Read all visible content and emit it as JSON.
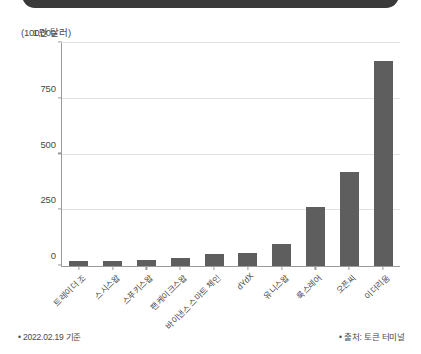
{
  "chart_data": {
    "type": "bar",
    "title": "",
    "subtitle": "",
    "unit_label": "(100만 달러)",
    "xlabel": "",
    "ylabel": "",
    "ylim": [
      0,
      1000
    ],
    "yticks": [
      0,
      250,
      500,
      750,
      1000
    ],
    "ytick_labels": [
      "0",
      "250",
      "500",
      "750",
      "1,000"
    ],
    "grid": true,
    "legend": "none",
    "bar_color": "#5e5e5e",
    "categories": [
      "트레이더 조",
      "스시스왑",
      "스푸키스왑",
      "팬케이크스왑",
      "바이낸스 스마트 체인",
      "dYdX",
      "유니스왑",
      "룩스레어",
      "오픈씨",
      "이더리움"
    ],
    "values": [
      22,
      24,
      25,
      38,
      56,
      60,
      100,
      265,
      420,
      920
    ]
  },
  "footnotes": {
    "left": "• 2022.02.19 기준",
    "right": "• 출처: 토큰 터미널"
  },
  "colors": {
    "bar": "#5e5e5e",
    "axis": "#9a9a9a",
    "grid": "#e2e2e2",
    "text": "#4a4a4a",
    "top_bar": "#3a3a3a"
  }
}
